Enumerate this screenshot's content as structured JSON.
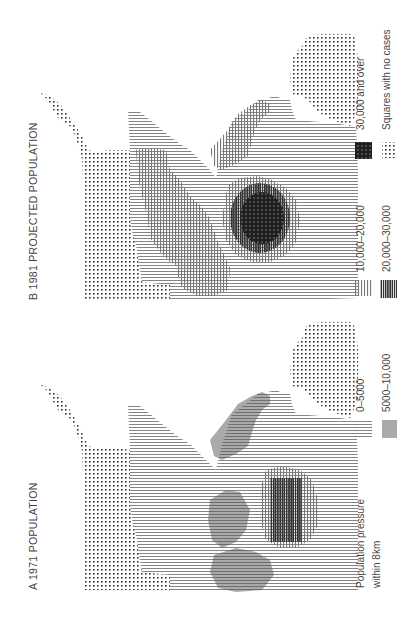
{
  "figure": {
    "orientation": "rotated 90 degrees counter-clockwise",
    "panels": [
      {
        "id": "A",
        "title": "A  1971  POPULATION",
        "legend": {
          "heading_line1": "Population  pressure",
          "heading_line2": "within  8km",
          "items": [
            {
              "label": "0–5000",
              "pattern": "vertical-lines-light"
            },
            {
              "label": "5000–10,000",
              "pattern": "vertical-lines-dense"
            }
          ]
        }
      },
      {
        "id": "B",
        "title": "B  1981  PROJECTED  POPULATION",
        "legend": {
          "items": [
            {
              "label": "10,000–20,000",
              "pattern": "horizontal-lines-light"
            },
            {
              "label": "20,000–30,000",
              "pattern": "horizontal-lines-dark"
            },
            {
              "label": "30,000 and over",
              "pattern": "solid-dark-grid"
            },
            {
              "label": "Squares with no cases",
              "pattern": "dots"
            }
          ]
        }
      }
    ],
    "colors": {
      "ink": "#333333",
      "light_ink": "#8a8a8a",
      "dark_ink": "#1a1a1a",
      "paper": "#ffffff"
    }
  }
}
